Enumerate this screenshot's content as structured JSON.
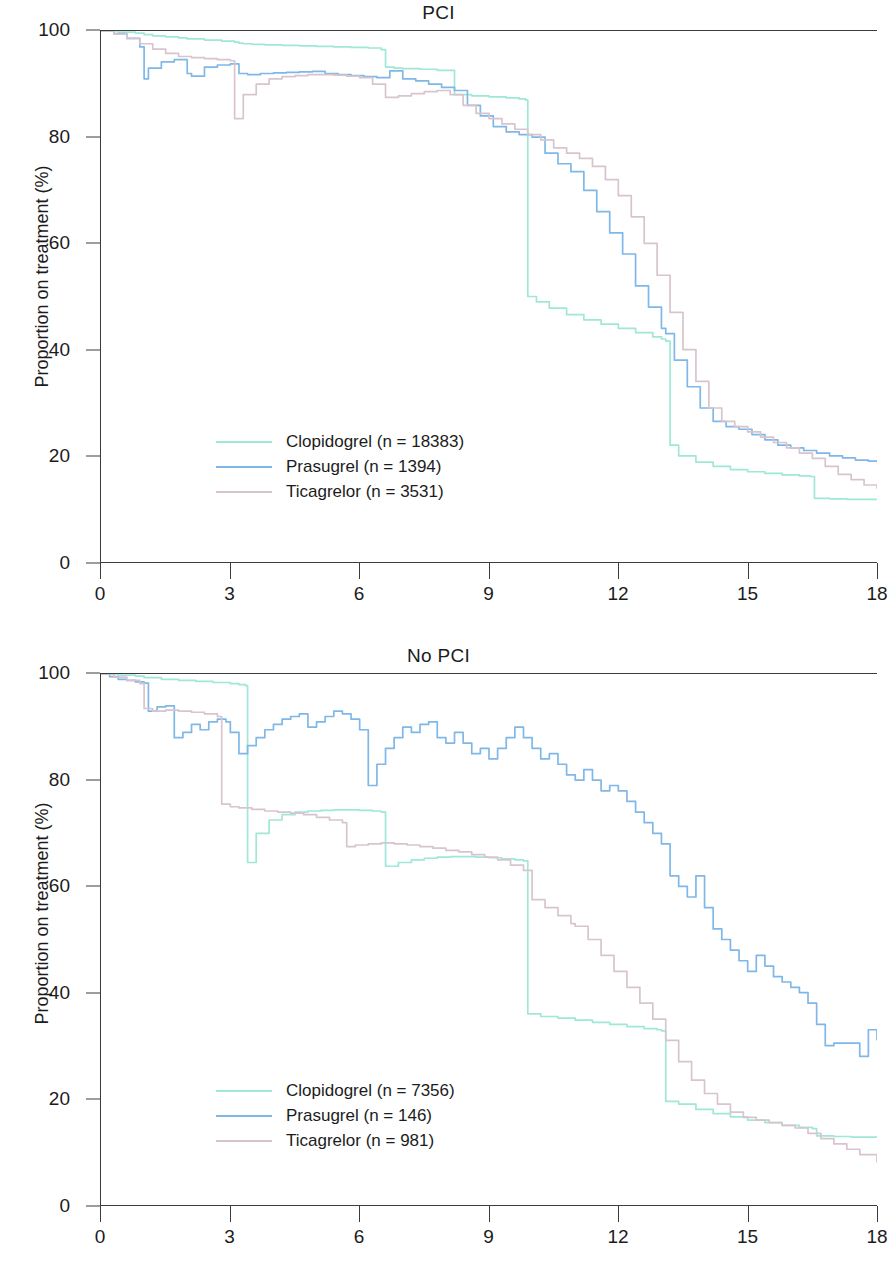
{
  "figure": {
    "ylabel": "Proportion on treatment (%)",
    "xlabel": "",
    "axis_color": "#3c3c3c"
  },
  "panels": [
    {
      "id": "pci",
      "title": "PCI",
      "ylabel": "Proportion on treatment (%)",
      "legend": [
        {
          "label": "Clopidogrel (n = 18383)",
          "color": "#9fe8d8"
        },
        {
          "label": "Prasugrel (n = 1394)",
          "color": "#7fb8e8"
        },
        {
          "label": "Ticagrelor (n = 3531)",
          "color": "#d8c4cf"
        }
      ]
    },
    {
      "id": "nopci",
      "title": "No PCI",
      "ylabel": "Proportion on treatment (%)",
      "legend": [
        {
          "label": "Clopidogrel (n = 7356)",
          "color": "#9fe8d8"
        },
        {
          "label": "Prasugrel (n = 146)",
          "color": "#7fb8e8"
        },
        {
          "label": "Ticagrelor (n = 981)",
          "color": "#d8c4cf"
        }
      ]
    }
  ],
  "yticks": [
    "0",
    "20",
    "40",
    "60",
    "80",
    "100"
  ],
  "xticks": [
    "0",
    "3",
    "6",
    "9",
    "12",
    "15",
    "18"
  ],
  "chart_data": [
    {
      "type": "line",
      "title": "PCI",
      "subtitle": "",
      "xlabel": "",
      "ylabel": "Proportion on treatment (%)",
      "xlim": [
        0,
        18
      ],
      "ylim": [
        0,
        100
      ],
      "xticks": [
        0,
        3,
        6,
        9,
        12,
        15,
        18
      ],
      "yticks": [
        0,
        20,
        40,
        60,
        80,
        100
      ],
      "grid": false,
      "legend_position": "bottom-left",
      "step": true,
      "series": [
        {
          "name": "Clopidogrel (n = 18383)",
          "color": "#9fe8d8",
          "x": [
            0.0,
            0.4,
            0.8,
            1.0,
            1.2,
            1.5,
            1.8,
            2.0,
            2.4,
            2.8,
            3.1,
            3.2,
            3.3,
            3.5,
            3.8,
            4.2,
            4.6,
            5.0,
            5.4,
            5.8,
            6.2,
            6.5,
            6.6,
            6.8,
            7.0,
            7.4,
            7.8,
            8.2,
            8.6,
            9.0,
            9.4,
            9.7,
            9.85,
            9.9,
            10.1,
            10.4,
            10.8,
            11.2,
            11.6,
            12.0,
            12.4,
            12.8,
            13.0,
            13.1,
            13.2,
            13.4,
            13.8,
            14.2,
            14.6,
            15.0,
            15.4,
            15.8,
            16.2,
            16.45,
            16.55,
            16.9,
            17.3,
            17.7,
            18.0
          ],
          "y": [
            100,
            99.8,
            99.6,
            99.3,
            99.1,
            98.9,
            98.7,
            98.5,
            98.3,
            98.1,
            97.9,
            97.7,
            97.6,
            97.5,
            97.4,
            97.3,
            97.2,
            97.1,
            97.0,
            96.9,
            96.8,
            96.5,
            93.2,
            93.0,
            92.9,
            92.8,
            92.6,
            88.0,
            87.8,
            87.6,
            87.4,
            87.2,
            87.0,
            50.0,
            49.0,
            47.8,
            46.6,
            45.6,
            44.8,
            44.0,
            43.2,
            42.4,
            42.0,
            41.6,
            22.0,
            20.0,
            18.8,
            18.0,
            17.4,
            17.0,
            16.7,
            16.4,
            16.2,
            16.1,
            12.0,
            11.9,
            11.8,
            11.8,
            11.8
          ]
        },
        {
          "name": "Prasugrel (n = 1394)",
          "color": "#7fb8e8",
          "x": [
            0.0,
            0.3,
            0.6,
            0.9,
            1.0,
            1.1,
            1.4,
            1.7,
            1.9,
            2.0,
            2.1,
            2.4,
            2.7,
            3.0,
            3.2,
            3.4,
            3.7,
            4.0,
            4.3,
            4.6,
            4.9,
            5.2,
            5.5,
            5.8,
            6.1,
            6.4,
            6.7,
            7.0,
            7.3,
            7.6,
            7.9,
            8.2,
            8.5,
            8.8,
            9.1,
            9.4,
            9.7,
            10.0,
            10.3,
            10.6,
            10.9,
            11.2,
            11.5,
            11.8,
            12.1,
            12.4,
            12.7,
            13.0,
            13.1,
            13.3,
            13.6,
            13.9,
            14.2,
            14.5,
            14.8,
            15.1,
            15.4,
            15.7,
            16.0,
            16.3,
            16.6,
            16.9,
            17.2,
            17.5,
            17.8,
            18.0
          ],
          "y": [
            100,
            99.5,
            98.6,
            97.0,
            91.0,
            93.0,
            94.2,
            94.6,
            94.6,
            92.0,
            91.5,
            93.2,
            93.6,
            93.8,
            92.0,
            91.8,
            92.0,
            92.1,
            92.2,
            92.3,
            92.4,
            92.0,
            91.8,
            91.6,
            91.4,
            91.2,
            92.5,
            91.0,
            90.6,
            90.0,
            89.4,
            88.8,
            86.0,
            84.0,
            82.0,
            81.0,
            80.5,
            80.0,
            77.0,
            75.0,
            73.5,
            70.0,
            66.0,
            62.0,
            58.0,
            52.0,
            48.0,
            44.0,
            43.0,
            38.0,
            33.0,
            29.0,
            26.5,
            25.5,
            25.0,
            24.0,
            23.0,
            22.0,
            21.5,
            21.0,
            20.5,
            20.0,
            19.6,
            19.2,
            19.0,
            18.8
          ]
        },
        {
          "name": "Ticagrelor (n = 3531)",
          "color": "#d8c4cf",
          "x": [
            0.0,
            0.3,
            0.6,
            0.9,
            1.2,
            1.5,
            1.8,
            2.1,
            2.4,
            2.7,
            3.0,
            3.1,
            3.3,
            3.6,
            3.9,
            4.2,
            4.5,
            4.8,
            5.1,
            5.4,
            5.7,
            6.0,
            6.3,
            6.6,
            6.9,
            7.2,
            7.5,
            7.8,
            8.1,
            8.4,
            8.7,
            9.0,
            9.3,
            9.6,
            9.9,
            10.2,
            10.5,
            10.8,
            11.1,
            11.4,
            11.7,
            12.0,
            12.3,
            12.6,
            12.9,
            13.2,
            13.5,
            13.8,
            14.1,
            14.4,
            14.7,
            15.0,
            15.3,
            15.6,
            15.9,
            16.2,
            16.5,
            16.8,
            17.1,
            17.4,
            17.7,
            18.0
          ],
          "y": [
            100,
            99.4,
            98.6,
            97.6,
            96.6,
            95.8,
            95.2,
            95.0,
            94.8,
            94.6,
            94.4,
            83.5,
            88.0,
            90.0,
            91.0,
            91.4,
            91.6,
            91.8,
            91.8,
            91.7,
            91.5,
            91.2,
            90.0,
            87.5,
            87.8,
            88.2,
            88.6,
            88.8,
            88.0,
            86.0,
            84.5,
            83.5,
            82.5,
            81.5,
            80.5,
            79.5,
            78.0,
            77.0,
            76.0,
            74.5,
            72.0,
            69.0,
            65.0,
            60.0,
            54.0,
            47.0,
            40.0,
            34.0,
            29.0,
            26.5,
            25.5,
            24.5,
            23.5,
            22.5,
            21.5,
            20.5,
            19.5,
            18.0,
            16.5,
            15.5,
            14.5,
            13.8
          ]
        }
      ]
    },
    {
      "type": "line",
      "title": "No PCI",
      "subtitle": "",
      "xlabel": "",
      "ylabel": "Proportion on treatment (%)",
      "xlim": [
        0,
        18
      ],
      "ylim": [
        0,
        100
      ],
      "xticks": [
        0,
        3,
        6,
        9,
        12,
        15,
        18
      ],
      "yticks": [
        0,
        20,
        40,
        60,
        80,
        100
      ],
      "grid": false,
      "legend_position": "bottom-left",
      "step": true,
      "series": [
        {
          "name": "Clopidogrel (n = 7356)",
          "color": "#9fe8d8",
          "x": [
            0.0,
            0.4,
            0.8,
            1.0,
            1.4,
            1.8,
            2.2,
            2.6,
            3.0,
            3.2,
            3.35,
            3.4,
            3.6,
            3.9,
            4.2,
            4.5,
            4.8,
            5.1,
            5.4,
            5.7,
            6.0,
            6.3,
            6.5,
            6.6,
            6.9,
            7.2,
            7.5,
            7.8,
            8.1,
            8.4,
            8.7,
            9.0,
            9.3,
            9.6,
            9.8,
            9.9,
            10.2,
            10.6,
            11.0,
            11.4,
            11.8,
            12.2,
            12.6,
            12.9,
            13.0,
            13.1,
            13.4,
            13.8,
            14.2,
            14.6,
            15.0,
            15.4,
            15.8,
            16.2,
            16.5,
            16.6,
            17.0,
            17.4,
            17.8,
            18.0
          ],
          "y": [
            100,
            99.8,
            99.6,
            99.3,
            99.0,
            98.8,
            98.6,
            98.4,
            98.2,
            98.0,
            97.8,
            64.5,
            70.0,
            72.5,
            73.5,
            74.0,
            74.2,
            74.3,
            74.4,
            74.4,
            74.3,
            74.2,
            74.0,
            63.8,
            64.5,
            65.0,
            65.3,
            65.5,
            65.6,
            65.6,
            65.5,
            65.4,
            65.2,
            65.0,
            64.8,
            36.0,
            35.5,
            35.2,
            34.8,
            34.4,
            34.0,
            33.6,
            33.2,
            33.0,
            32.8,
            19.5,
            19.0,
            18.0,
            17.2,
            16.6,
            16.0,
            15.5,
            15.0,
            14.6,
            14.4,
            13.0,
            12.9,
            12.8,
            12.8,
            12.8
          ]
        },
        {
          "name": "Prasugrel (n = 146)",
          "color": "#7fb8e8",
          "x": [
            0.0,
            0.2,
            0.4,
            0.6,
            0.8,
            1.0,
            1.1,
            1.3,
            1.5,
            1.7,
            1.9,
            2.1,
            2.3,
            2.5,
            2.7,
            2.9,
            3.0,
            3.2,
            3.4,
            3.6,
            3.8,
            4.0,
            4.2,
            4.4,
            4.6,
            4.8,
            5.0,
            5.2,
            5.4,
            5.6,
            5.8,
            6.0,
            6.2,
            6.4,
            6.6,
            6.8,
            7.0,
            7.2,
            7.4,
            7.6,
            7.8,
            8.0,
            8.2,
            8.4,
            8.6,
            8.8,
            9.0,
            9.2,
            9.4,
            9.6,
            9.8,
            10.0,
            10.2,
            10.4,
            10.6,
            10.8,
            11.0,
            11.2,
            11.4,
            11.6,
            11.8,
            12.0,
            12.2,
            12.4,
            12.6,
            12.8,
            13.0,
            13.2,
            13.4,
            13.6,
            13.8,
            14.0,
            14.2,
            14.4,
            14.6,
            14.8,
            15.0,
            15.2,
            15.4,
            15.6,
            15.8,
            16.0,
            16.2,
            16.4,
            16.6,
            16.8,
            17.0,
            17.2,
            17.4,
            17.6,
            17.8,
            18.0
          ],
          "y": [
            100,
            99.5,
            99.0,
            98.8,
            98.5,
            98.3,
            93.0,
            93.8,
            94.0,
            88.0,
            89.0,
            90.5,
            89.5,
            91.0,
            91.5,
            91.0,
            89.0,
            85.0,
            86.5,
            88.0,
            89.5,
            90.5,
            91.5,
            92.0,
            92.5,
            90.0,
            91.0,
            92.0,
            93.0,
            92.5,
            91.5,
            89.5,
            79.0,
            83.0,
            86.0,
            88.0,
            90.0,
            89.0,
            90.5,
            91.0,
            88.0,
            87.0,
            89.0,
            87.0,
            85.0,
            86.0,
            84.0,
            86.0,
            88.0,
            90.0,
            88.0,
            86.0,
            84.0,
            85.0,
            83.0,
            81.0,
            80.0,
            82.0,
            80.0,
            78.0,
            79.0,
            78.0,
            76.0,
            74.0,
            72.0,
            70.0,
            68.0,
            62.0,
            60.0,
            58.0,
            62.0,
            56.0,
            52.0,
            50.0,
            48.0,
            46.0,
            44.0,
            47.0,
            45.0,
            43.0,
            42.0,
            41.0,
            40.0,
            38.0,
            34.0,
            30.0,
            30.5,
            30.5,
            30.5,
            28.0,
            33.0,
            31.0
          ]
        },
        {
          "name": "Ticagrelor (n = 981)",
          "color": "#d8c4cf",
          "x": [
            0.0,
            0.3,
            0.6,
            0.9,
            1.0,
            1.2,
            1.5,
            1.8,
            2.1,
            2.4,
            2.7,
            2.8,
            3.0,
            3.2,
            3.5,
            3.8,
            4.1,
            4.4,
            4.7,
            5.0,
            5.3,
            5.6,
            5.7,
            5.9,
            6.2,
            6.5,
            6.8,
            7.1,
            7.4,
            7.7,
            8.0,
            8.3,
            8.6,
            8.9,
            9.2,
            9.5,
            9.8,
            10.0,
            10.3,
            10.6,
            10.9,
            11.0,
            11.3,
            11.6,
            11.9,
            12.2,
            12.5,
            12.8,
            13.1,
            13.4,
            13.7,
            14.0,
            14.3,
            14.6,
            14.9,
            15.2,
            15.5,
            15.8,
            16.1,
            16.4,
            16.7,
            17.0,
            17.3,
            17.6,
            18.0
          ],
          "y": [
            100,
            99.4,
            98.8,
            98.2,
            93.5,
            93.0,
            93.2,
            93.0,
            92.8,
            92.5,
            92.0,
            75.5,
            75.0,
            74.8,
            74.5,
            74.2,
            74.0,
            73.8,
            73.5,
            73.0,
            72.5,
            72.0,
            67.5,
            67.8,
            68.0,
            68.2,
            68.0,
            67.8,
            67.5,
            67.2,
            66.8,
            66.5,
            66.0,
            65.5,
            65.0,
            64.0,
            63.0,
            57.5,
            56.0,
            54.5,
            53.0,
            52.5,
            50.0,
            47.0,
            44.0,
            41.0,
            38.0,
            35.0,
            31.0,
            27.0,
            23.5,
            21.0,
            19.0,
            17.5,
            16.5,
            16.0,
            15.5,
            15.0,
            14.5,
            13.5,
            12.5,
            11.5,
            10.5,
            9.5,
            8.0
          ]
        }
      ]
    }
  ]
}
